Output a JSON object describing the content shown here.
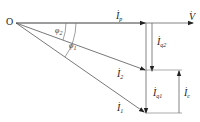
{
  "diagram": {
    "type": "phasor-diagram",
    "origin_label": "O",
    "colors": {
      "line": "#555555",
      "text": "#222222",
      "background": "#ffffff"
    },
    "vectors": [
      {
        "id": "V",
        "label": "V",
        "sub": "",
        "dot": "·"
      },
      {
        "id": "Ip",
        "label": "I",
        "sub": "p",
        "dot": "·"
      },
      {
        "id": "Iq2",
        "label": "I",
        "sub": "q2",
        "dot": "·"
      },
      {
        "id": "I2",
        "label": "I",
        "sub": "2",
        "dot": "·"
      },
      {
        "id": "Iq1",
        "label": "I",
        "sub": "q1",
        "dot": "·"
      },
      {
        "id": "Ic",
        "label": "I",
        "sub": "c",
        "dot": "·"
      },
      {
        "id": "I1",
        "label": "I",
        "sub": "1",
        "dot": "·"
      }
    ],
    "angles": [
      {
        "id": "phi2",
        "label": "φ",
        "sub": "2"
      },
      {
        "id": "phi1",
        "label": "φ",
        "sub": "1"
      }
    ]
  }
}
